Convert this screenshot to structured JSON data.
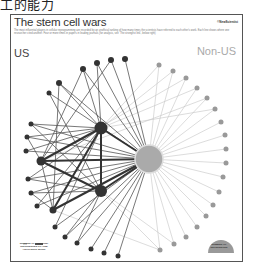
{
  "caption": "工的能力",
  "figure": {
    "title": "The stem cell wars",
    "brand": "©NewScientist",
    "description": "The most influential players in cellular reprogramming are recorded by an unofficial ranking of how many times the scientists have referred to each other's work. Each line shows where one researcher cited another. Four or more times in papers in leading journals (for analysis, see 'The strongest link', below right)",
    "region_labels": {
      "us": "US",
      "non_us": "Non-US"
    },
    "legend_left": {
      "text": "NUMBER OF AUTHORS' REFERENCES TO ONE ANOTHER'S WORK",
      "low": "Low",
      "high": "High"
    },
    "legend_right": {
      "text": "NUMBER OF REFERENCES"
    }
  },
  "colors": {
    "us_node": "#333333",
    "non_us_node": "#999999",
    "hub": "#aaaaaa",
    "edge_us": "#555555",
    "edge_non_us": "#bbbbbb"
  }
}
